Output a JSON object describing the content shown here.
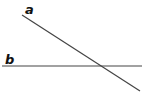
{
  "diagram": {
    "type": "intersecting-lines",
    "line_color": "#444444",
    "label_color": "#111111",
    "lines": [
      {
        "name": "a",
        "label": "a",
        "x1": 22,
        "y1": 15,
        "x2": 140,
        "y2": 91
      },
      {
        "name": "b",
        "label": "b",
        "x1": 2,
        "y1": 66,
        "x2": 142,
        "y2": 66
      }
    ]
  }
}
